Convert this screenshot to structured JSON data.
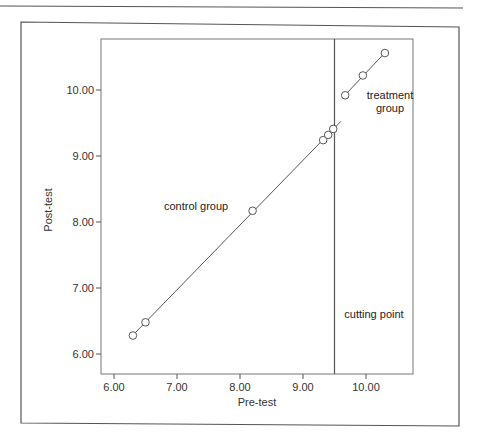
{
  "chart_data": {
    "type": "scatter",
    "title": "",
    "xlabel": "Pre-test",
    "ylabel": "Post-test",
    "xlim": [
      5.8,
      10.75
    ],
    "ylim": [
      5.7,
      10.75
    ],
    "x_ticks": [
      6.0,
      7.0,
      8.0,
      9.0,
      10.0
    ],
    "x_tick_labels": [
      "6.00",
      "7.00",
      "8.00",
      "9.00",
      "10.00"
    ],
    "y_ticks": [
      6.0,
      7.0,
      8.0,
      9.0,
      10.0
    ],
    "y_tick_labels": [
      "6.00",
      "7.00",
      "8.00",
      "9.00",
      "10.00"
    ],
    "grid": false,
    "cutting_point": 9.5,
    "series": [
      {
        "name": "control group",
        "marker": "open-circle",
        "line": "linear-fit",
        "points": [
          {
            "x": 6.3,
            "y": 6.28
          },
          {
            "x": 6.5,
            "y": 6.48
          },
          {
            "x": 8.2,
            "y": 8.17
          },
          {
            "x": 9.32,
            "y": 9.24
          },
          {
            "x": 9.4,
            "y": 9.32
          },
          {
            "x": 9.48,
            "y": 9.41
          }
        ],
        "fit_line": {
          "x_start": 6.3,
          "x_end": 9.6
        }
      },
      {
        "name": "treatment group",
        "marker": "open-circle",
        "line": "linear-fit",
        "points": [
          {
            "x": 9.67,
            "y": 9.92
          },
          {
            "x": 9.95,
            "y": 10.22
          },
          {
            "x": 10.3,
            "y": 10.56
          }
        ],
        "fit_line": {
          "x_start": 9.67,
          "x_end": 10.3
        }
      }
    ],
    "annotations": [
      {
        "text": "control group",
        "x": 7.1,
        "y": 8.25
      },
      {
        "text": "treatment group",
        "x": 10.1,
        "y": 9.75
      },
      {
        "text": "cutting point",
        "x": 10.0,
        "y": 6.5
      }
    ],
    "legend": "none"
  },
  "labels": {
    "xlabel": "Pre-test",
    "ylabel": "Post-test",
    "x_ticks": [
      "6.00",
      "7.00",
      "8.00",
      "9.00",
      "10.00"
    ],
    "y_ticks": [
      "6.00",
      "7.00",
      "8.00",
      "9.00",
      "10.00"
    ],
    "control_group": "control group",
    "treatment_line1": "treatment",
    "treatment_line2": "group",
    "cutting_point": "cutting point"
  },
  "colors": {
    "axis": "#555555",
    "line": "#444444",
    "marker_stroke": "#444444",
    "marker_fill": "#ffffff"
  }
}
